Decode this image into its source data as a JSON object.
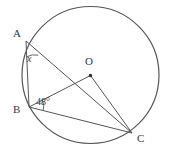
{
  "figure": {
    "kind": "circle-geometry-diagram",
    "background_color": "#ffffff",
    "stroke_color": "#555555",
    "text_color": "#3b3b3b"
  },
  "labels": {
    "point_a": "A",
    "point_b": "B",
    "point_o": "O",
    "point_c": "C",
    "unknown_angle": "x",
    "known_angle": "48°"
  },
  "geometry": {
    "circle": {
      "cx": 90.5,
      "cy": 75,
      "r": 68.5
    },
    "points": {
      "A": {
        "x": 26,
        "y": 41
      },
      "B": {
        "x": 29,
        "y": 107
      },
      "O": {
        "x": 90.5,
        "y": 75.5
      },
      "C": {
        "x": 132,
        "y": 133
      }
    },
    "segments": [
      {
        "name": "AB",
        "from": "A",
        "to": "B"
      },
      {
        "name": "AC",
        "from": "A",
        "to": "C"
      },
      {
        "name": "BO",
        "from": "B",
        "to": "O"
      },
      {
        "name": "BC",
        "from": "B",
        "to": "C"
      },
      {
        "name": "OC",
        "from": "O",
        "to": "C"
      }
    ],
    "angle_marks": [
      {
        "name": "angle-BAC",
        "vertex": "A",
        "label": "x"
      },
      {
        "name": "angle-OBC",
        "vertex": "B",
        "label": "48°"
      }
    ]
  }
}
